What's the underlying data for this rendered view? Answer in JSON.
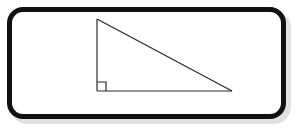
{
  "figure": {
    "kind": "right-triangle-mnemonic-diagram",
    "mnemonic": "FOR SHORTER SIDES SUBTRACT",
    "frame": {
      "border_color": "#111111",
      "background_color": "#ffffff",
      "border_radius_px": 16,
      "border_width_px": 5
    },
    "triangle": {
      "stroke_color": "#2b2b2b",
      "stroke_width_px": 1,
      "apex": {
        "x": 97,
        "y": 19
      },
      "right_angle_vertex": {
        "x": 97,
        "y": 91
      },
      "far_vertex": {
        "x": 232,
        "y": 91
      },
      "right_angle_marker": {
        "size_px": 9,
        "label": "right-angle-square"
      }
    },
    "vertical_leg_letters": [
      {
        "char": "F",
        "x": 85,
        "y": 22
      },
      {
        "char": "O",
        "x": 85,
        "y": 34
      },
      {
        "char": "R",
        "x": 85,
        "y": 46
      },
      {
        "char": "S",
        "x": 85,
        "y": 64
      },
      {
        "char": "H",
        "x": 85,
        "y": 76
      },
      {
        "char": "O",
        "x": 85,
        "y": 88
      },
      {
        "char": "R",
        "x": 89,
        "y": 98
      }
    ],
    "vertical_leg_text": "FOR SHOR",
    "horizontal_leg_words": [
      {
        "text": "TER",
        "x": 100,
        "y": 100
      },
      {
        "text": "SIDES",
        "x": 133,
        "y": 100
      },
      {
        "text": "SUBTRACT",
        "x": 177,
        "y": 100
      }
    ],
    "horizontal_leg_text": "TER SIDES SUBTRACT",
    "colors": {
      "ink": "#1a1a1a",
      "line": "#2b2b2b",
      "frame": "#111111",
      "paper": "#ffffff"
    }
  }
}
